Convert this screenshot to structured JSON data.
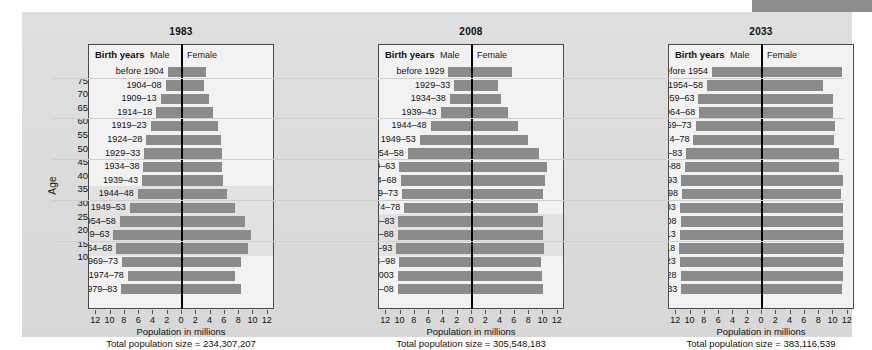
{
  "figure": {
    "age_axis_label": "Age",
    "age_ticks": [
      "80+",
      "75–79",
      "70–74",
      "65–69",
      "60–64",
      "55–59",
      "50–54",
      "45–49",
      "40–44",
      "35–39",
      "30–34",
      "25–29",
      "20–24",
      "15–19",
      "10–14",
      "5–9",
      "0–4"
    ],
    "header_birth_years": "Birth years",
    "header_male": "Male",
    "header_female": "Female",
    "axis_title": "Population in millions",
    "bar_color": "#8b8b8b",
    "band_color": "#e2e2e2",
    "panel_bg": "#f2f2f2",
    "figure_bg": "#dcdcdc"
  },
  "chart_data": {
    "type": "bar",
    "xlabel": "Population in millions",
    "ylabel": "Age",
    "xlim": [
      -12,
      12
    ],
    "xticks": [
      12,
      10,
      8,
      6,
      4,
      2,
      0,
      2,
      4,
      6,
      8,
      10,
      12
    ],
    "xtick_values": [
      -12,
      -10,
      -8,
      -6,
      -4,
      -2,
      0,
      2,
      4,
      6,
      8,
      10,
      12
    ],
    "grid": false,
    "legend": [
      "Male",
      "Female"
    ],
    "legend_position": "top-center",
    "age_groups": [
      "80+",
      "75–79",
      "70–74",
      "65–69",
      "60–64",
      "55–59",
      "50–54",
      "45–49",
      "40–44",
      "35–39",
      "30–34",
      "25–29",
      "20–24",
      "15–19",
      "10–14",
      "5–9",
      "0–4"
    ],
    "panels": [
      {
        "year": "1983",
        "total_population_label": "Total population size = 234,307,207",
        "total_population": 234307207,
        "birth_years": [
          "before 1904",
          "1904–08",
          "1909–13",
          "1914–18",
          "1919–23",
          "1924–28",
          "1929–33",
          "1934–38",
          "1939–43",
          "1944–48",
          "1949–53",
          "1954–58",
          "1959–63",
          "1964–68",
          "1969–73",
          "1974–78",
          "1979–83"
        ],
        "male": [
          2.0,
          2.3,
          3.0,
          3.6,
          4.4,
          5.0,
          5.3,
          5.4,
          5.6,
          6.2,
          7.3,
          8.7,
          9.6,
          9.2,
          8.4,
          7.6,
          8.5
        ],
        "female": [
          3.4,
          3.1,
          3.8,
          4.3,
          5.0,
          5.4,
          5.6,
          5.6,
          5.7,
          6.3,
          7.4,
          8.8,
          9.7,
          9.2,
          8.3,
          7.4,
          8.2
        ],
        "highlight_band": {
          "from": "1944–48",
          "to": "1964–68"
        }
      },
      {
        "year": "2008",
        "total_population_label": "Total population size = 305,548,183",
        "total_population": 305548183,
        "birth_years": [
          "before 1929",
          "1929–33",
          "1934–38",
          "1939–43",
          "1944–48",
          "1949–53",
          "1954–58",
          "1959–63",
          "1964–68",
          "1969–73",
          "1974–78",
          "1979–83",
          "1984–88",
          "1989–93",
          "1994–98",
          "1999–2003",
          "2004–08"
        ],
        "male": [
          3.3,
          2.5,
          3.1,
          4.4,
          5.8,
          7.3,
          9.0,
          10.2,
          10.0,
          9.8,
          9.5,
          10.3,
          10.4,
          10.6,
          10.2,
          10.4,
          10.4
        ],
        "female": [
          5.6,
          3.7,
          4.0,
          5.1,
          6.4,
          7.8,
          9.4,
          10.5,
          10.2,
          9.9,
          9.3,
          10.0,
          9.9,
          10.1,
          9.6,
          9.8,
          10.0
        ],
        "highlight_band": {
          "from": "1979–83",
          "to": "1989–93"
        }
      },
      {
        "year": "2033",
        "total_population_label": "Total population size = 383,116,539",
        "total_population": 383116539,
        "birth_years": [
          "before 1954",
          "1954–58",
          "1959–63",
          "1964–68",
          "1969–73",
          "1974–78",
          "1979–83",
          "1984–88",
          "1989–93",
          "1994–98",
          "1999–2003",
          "2004–08",
          "2009–13",
          "2014–18",
          "2019–23",
          "2024–28",
          "2029–33"
        ],
        "male": [
          7.0,
          7.7,
          8.9,
          8.8,
          9.3,
          9.6,
          10.6,
          10.8,
          11.3,
          11.2,
          11.5,
          11.4,
          11.5,
          11.6,
          11.5,
          11.4,
          11.3
        ],
        "female": [
          11.2,
          8.5,
          10.0,
          10.0,
          10.2,
          10.1,
          10.8,
          10.8,
          11.3,
          11.1,
          11.4,
          11.3,
          11.4,
          11.5,
          11.4,
          11.3,
          11.2
        ],
        "highlight_band": null
      }
    ]
  }
}
